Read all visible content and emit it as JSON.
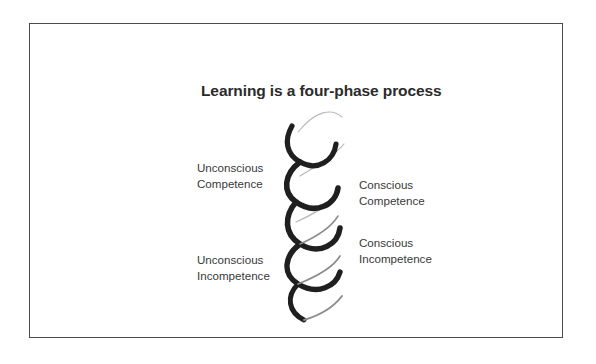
{
  "figure": {
    "title": "Learning is a four-phase process",
    "frame": {
      "border_color": "#4a4a4a",
      "background": "#ffffff"
    },
    "colors": {
      "title_text": "#2b2b2b",
      "label_text": "#3a3a3a",
      "helix_front_strand": "#1f1f1f",
      "helix_back_strand": "#b9b9b9",
      "frame_border": "#4a4a4a",
      "page_background": "#ffffff"
    },
    "diagram": {
      "type": "helix-spiral",
      "name": "four-phase learning helix",
      "strands": 2,
      "front_strand_color": "#1f1f1f",
      "back_strand_color": "#b9b9b9"
    },
    "labels": [
      {
        "id": "unconscious-competence",
        "side": "left",
        "position": "upper",
        "line1": "Unconscious",
        "line2": "Competence"
      },
      {
        "id": "conscious-competence",
        "side": "right",
        "position": "upper-middle",
        "line1": "Conscious",
        "line2": "Competence"
      },
      {
        "id": "conscious-incompetence",
        "side": "right",
        "position": "lower-middle",
        "line1": "Conscious",
        "line2": "Incompetence"
      },
      {
        "id": "unconscious-incompetence",
        "side": "left",
        "position": "lower",
        "line1": "Unconscious",
        "line2": "Incompetence"
      }
    ]
  }
}
